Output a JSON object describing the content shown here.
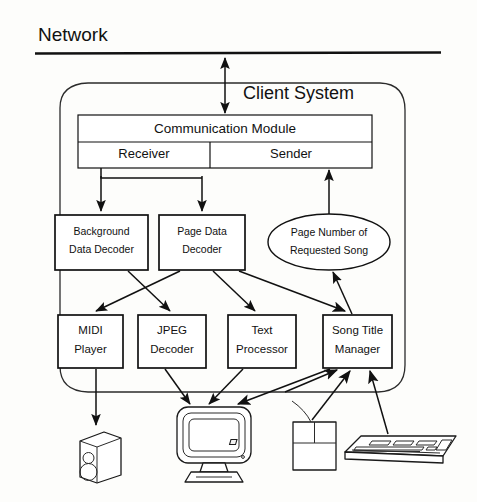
{
  "figure": {
    "domain": "diagram",
    "network_label": "Network",
    "client_label": "Client System"
  },
  "nodes": {
    "communication_module": "Communication Module",
    "receiver": "Receiver",
    "sender": "Sender",
    "background_data_decoder_line1": "Background",
    "background_data_decoder_line2": "Data Decoder",
    "page_data_decoder_line1": "Page Data",
    "page_data_decoder_line2": "Decoder",
    "page_number_line1": "Page Number of",
    "page_number_line2": "Requested Song",
    "midi_player_line1": "MIDI",
    "midi_player_line2": "Player",
    "jpeg_decoder_line1": "JPEG",
    "jpeg_decoder_line2": "Decoder",
    "text_processor_line1": "Text",
    "text_processor_line2": "Processor",
    "song_title_manager_line1": "Song Title",
    "song_title_manager_line2": "Manager"
  },
  "devices": {
    "speaker": "speaker-icon",
    "monitor": "monitor-icon",
    "mouse": "mouse-icon",
    "keyboard": "keyboard-icon"
  },
  "connections": [
    {
      "from": "network",
      "to": "client-system",
      "type": "bidirectional"
    },
    {
      "from": "receiver",
      "to": "background-data-decoder",
      "type": "arrow"
    },
    {
      "from": "receiver",
      "to": "page-data-decoder",
      "type": "arrow"
    },
    {
      "from": "page-number-of-requested-song",
      "to": "sender",
      "type": "arrow"
    },
    {
      "from": "background-data-decoder",
      "to": "jpeg-decoder",
      "type": "arrow"
    },
    {
      "from": "page-data-decoder",
      "to": "midi-player",
      "type": "arrow"
    },
    {
      "from": "page-data-decoder",
      "to": "text-processor",
      "type": "arrow"
    },
    {
      "from": "page-data-decoder",
      "to": "song-title-manager",
      "type": "arrow"
    },
    {
      "from": "song-title-manager",
      "to": "page-number-of-requested-song",
      "type": "arrow"
    },
    {
      "from": "midi-player",
      "to": "speaker",
      "type": "arrow"
    },
    {
      "from": "jpeg-decoder",
      "to": "monitor",
      "type": "arrow"
    },
    {
      "from": "text-processor",
      "to": "monitor",
      "type": "arrow"
    },
    {
      "from": "song-title-manager",
      "to": "monitor",
      "type": "arrow"
    },
    {
      "from": "mouse",
      "to": "song-title-manager",
      "type": "arrow"
    },
    {
      "from": "keyboard",
      "to": "song-title-manager",
      "type": "arrow"
    }
  ],
  "colors": {
    "stroke": "#111111",
    "background": "#fdfdfb"
  }
}
